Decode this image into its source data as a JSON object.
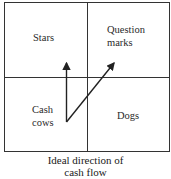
{
  "diagram": {
    "quadrants": {
      "top_left": "Stars",
      "top_right_line1": "Question",
      "top_right_line2": "marks",
      "bottom_left_line1": "Cash",
      "bottom_left_line2": "cows",
      "bottom_right": "Dogs"
    },
    "arrows": [
      {
        "from": "Cash cows",
        "to": "Stars"
      },
      {
        "from": "Cash cows",
        "to": "Question marks"
      }
    ],
    "caption_line1": "Ideal direction of",
    "caption_line2": "cash flow"
  }
}
